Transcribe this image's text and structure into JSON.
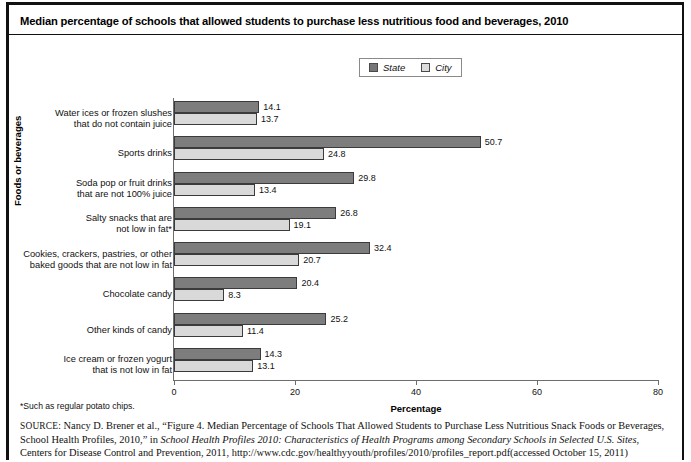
{
  "title": "Median percentage of schools that allowed students to purchase less nutritious food and beverages, 2010",
  "legend": {
    "state_label": "State",
    "city_label": "City",
    "state_color": "#7d7d7d",
    "city_color": "#d9d9d9"
  },
  "axes": {
    "xlabel": "Percentage",
    "ylabel": "Foods or beverages",
    "xticks": [
      "0",
      "20",
      "40",
      "60",
      "80"
    ]
  },
  "footnote": "*Such as regular potato chips.",
  "source": {
    "prefix": "SOURCE:",
    "part1": " Nancy D. Brener et al., “Figure 4. Median Percentage of Schools That Allowed Students to Purchase Less Nutritious Snack Foods or Beverages, School Health Profiles, 2010,” in ",
    "italic1": "School Health Profiles 2010: Characteristics of Health Programs among Secondary Schools in Selected U.S. Sites",
    "part2": ", Centers for Disease Control and Prevention, 2011, http://www.cdc.gov/healthyyouth/profiles/2010/profiles_report.pdf(accessed October 15, 2011)"
  },
  "chart_data": {
    "type": "bar",
    "title": "Median percentage of schools that allowed students to purchase less nutritious food and beverages, 2010",
    "xlabel": "Percentage",
    "ylabel": "Foods or beverages",
    "xlim": [
      0,
      80
    ],
    "grid": false,
    "orientation": "horizontal",
    "legend_position": "top-center",
    "categories": [
      "Water ices or frozen slushes that do not contain juice",
      "Sports drinks",
      "Soda pop or fruit drinks that are not 100% juice",
      "Salty snacks that are not low in fat*",
      "Cookies, crackers, pastries, or other baked goods that are not low in fat",
      "Chocolate candy",
      "Other kinds of candy",
      "Ice cream or frozen yogurt that is not low in fat"
    ],
    "category_lines": [
      [
        "Water ices or frozen slushes",
        "that do not contain juice"
      ],
      [
        "Sports drinks"
      ],
      [
        "Soda pop or fruit drinks",
        "that are not 100% juice"
      ],
      [
        "Salty snacks that are",
        "not low in fat*"
      ],
      [
        "Cookies, crackers, pastries, or other",
        "baked goods that are not low in fat"
      ],
      [
        "Chocolate candy"
      ],
      [
        "Other kinds of candy"
      ],
      [
        "Ice cream or frozen yogurt",
        "that is not low in fat"
      ]
    ],
    "series": [
      {
        "name": "State",
        "values": [
          14.1,
          50.7,
          29.8,
          26.8,
          32.4,
          20.4,
          25.2,
          14.3
        ]
      },
      {
        "name": "City",
        "values": [
          13.7,
          24.8,
          13.4,
          19.1,
          20.7,
          8.3,
          11.4,
          13.1
        ]
      }
    ]
  }
}
